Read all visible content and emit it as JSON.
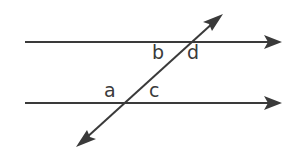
{
  "diagram": {
    "stroke_color": "#3a3a3a",
    "background": "#ffffff",
    "lines": [
      {
        "name": "top-parallel-line",
        "x1": 25,
        "y1": 42,
        "x2": 282,
        "y2": 42,
        "arrow": "end"
      },
      {
        "name": "bottom-parallel-line",
        "x1": 25,
        "y1": 103,
        "x2": 282,
        "y2": 103,
        "arrow": "end"
      },
      {
        "name": "transversal",
        "x1": 76,
        "y1": 147,
        "x2": 223,
        "y2": 14,
        "arrow": "both"
      }
    ],
    "angle_labels": [
      {
        "id": "a",
        "text": "a",
        "x": 104,
        "y": 97
      },
      {
        "id": "b",
        "text": "b",
        "x": 152,
        "y": 59
      },
      {
        "id": "c",
        "text": "c",
        "x": 149,
        "y": 97
      },
      {
        "id": "d",
        "text": "d",
        "x": 187,
        "y": 59
      }
    ]
  }
}
